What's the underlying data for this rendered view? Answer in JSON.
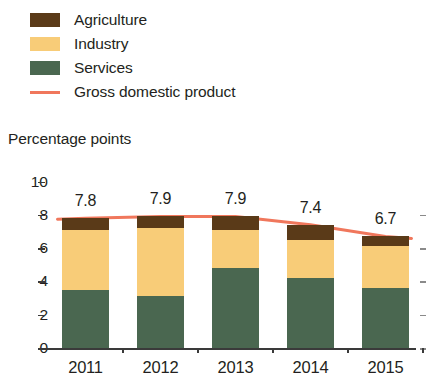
{
  "legend": {
    "items": [
      {
        "label": "Agriculture",
        "color": "#5a3a18",
        "marker": "swatch"
      },
      {
        "label": "Industry",
        "color": "#f8cc78",
        "marker": "swatch"
      },
      {
        "label": "Services",
        "color": "#4a6750",
        "marker": "swatch"
      },
      {
        "label": "Gross domestic product",
        "color": "#f0775c",
        "marker": "line"
      }
    ]
  },
  "chart_data": {
    "type": "bar",
    "stacked": true,
    "title": "",
    "subtitle": "",
    "xlabel": "",
    "ylabel": "Percentage points",
    "ylim": [
      0,
      10
    ],
    "yticks": [
      10,
      8,
      6,
      4,
      2,
      0
    ],
    "grid": false,
    "legend_position": "top-left",
    "categories": [
      "2011",
      "2012",
      "2013",
      "2014",
      "2015"
    ],
    "series": [
      {
        "name": "Services",
        "color": "#4a6750",
        "values": [
          3.5,
          3.1,
          4.8,
          4.2,
          3.6
        ]
      },
      {
        "name": "Industry",
        "color": "#f8cc78",
        "values": [
          3.6,
          4.1,
          2.3,
          2.3,
          2.5
        ]
      },
      {
        "name": "Agriculture",
        "color": "#5a3a18",
        "values": [
          0.7,
          0.7,
          0.8,
          0.9,
          0.6
        ]
      }
    ],
    "overlay_line": {
      "name": "Gross domestic product",
      "color": "#f0775c",
      "values": [
        7.8,
        7.9,
        7.9,
        7.4,
        6.7
      ]
    },
    "data_labels": [
      "7.8",
      "7.9",
      "7.9",
      "7.4",
      "6.7"
    ]
  }
}
